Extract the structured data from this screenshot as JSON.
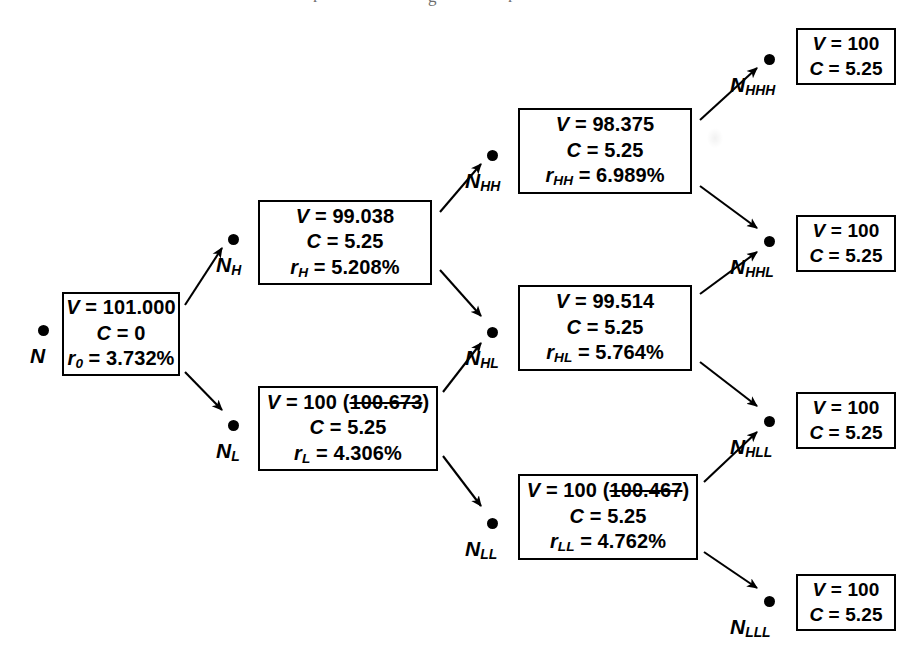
{
  "figure": {
    "kind": "binomial-interest-rate-tree",
    "cropped_caption_descenders": "r       g       r"
  },
  "nodes": [
    {
      "id": "N",
      "label": "N",
      "sub": "",
      "dot": {
        "x": 38,
        "y": 325
      },
      "label_pos": {
        "x": 30,
        "y": 345
      },
      "box": {
        "x": 62,
        "y": 292,
        "w": 118,
        "h": 84
      },
      "lines": [
        {
          "var": "V",
          "sub": "",
          "eq": "=",
          "value": "101.000",
          "strike": null,
          "suffix": ""
        },
        {
          "var": "C",
          "sub": "",
          "eq": "=",
          "value": "0",
          "strike": null,
          "suffix": ""
        },
        {
          "var": "r",
          "sub": "0",
          "eq": "=",
          "value": "3.732%",
          "strike": null,
          "suffix": ""
        }
      ]
    },
    {
      "id": "NH",
      "label": "N",
      "sub": "H",
      "dot": {
        "x": 228,
        "y": 234
      },
      "label_pos": {
        "x": 216,
        "y": 254
      },
      "box": {
        "x": 258,
        "y": 200,
        "w": 174,
        "h": 85
      },
      "lines": [
        {
          "var": "V",
          "sub": "",
          "eq": "=",
          "value": "99.038",
          "strike": null,
          "suffix": ""
        },
        {
          "var": "C",
          "sub": "",
          "eq": "=",
          "value": "5.25",
          "strike": null,
          "suffix": ""
        },
        {
          "var": "r",
          "sub": "H",
          "eq": "=",
          "value": "5.208%",
          "strike": null,
          "suffix": ""
        }
      ]
    },
    {
      "id": "NL",
      "label": "N",
      "sub": "L",
      "dot": {
        "x": 228,
        "y": 420
      },
      "label_pos": {
        "x": 216,
        "y": 440
      },
      "box": {
        "x": 258,
        "y": 386,
        "w": 180,
        "h": 85
      },
      "lines": [
        {
          "var": "V",
          "sub": "",
          "eq": "=",
          "value": "100",
          "strike": "100.673",
          "suffix": ""
        },
        {
          "var": "C",
          "sub": "",
          "eq": "=",
          "value": "5.25",
          "strike": null,
          "suffix": ""
        },
        {
          "var": "r",
          "sub": "L",
          "eq": "=",
          "value": "4.306%",
          "strike": null,
          "suffix": ""
        }
      ]
    },
    {
      "id": "NHH",
      "label": "N",
      "sub": "HH",
      "dot": {
        "x": 487,
        "y": 150
      },
      "label_pos": {
        "x": 465,
        "y": 170
      },
      "box": {
        "x": 518,
        "y": 108,
        "w": 174,
        "h": 86
      },
      "lines": [
        {
          "var": "V",
          "sub": "",
          "eq": "=",
          "value": "98.375",
          "strike": null,
          "suffix": ""
        },
        {
          "var": "C",
          "sub": "",
          "eq": "=",
          "value": "5.25",
          "strike": null,
          "suffix": ""
        },
        {
          "var": "r",
          "sub": "HH",
          "eq": "=",
          "value": "6.989%",
          "strike": null,
          "suffix": ""
        }
      ]
    },
    {
      "id": "NHL",
      "label": "N",
      "sub": "HL",
      "dot": {
        "x": 487,
        "y": 327
      },
      "label_pos": {
        "x": 465,
        "y": 347
      },
      "box": {
        "x": 518,
        "y": 285,
        "w": 174,
        "h": 86
      },
      "lines": [
        {
          "var": "V",
          "sub": "",
          "eq": "=",
          "value": "99.514",
          "strike": null,
          "suffix": ""
        },
        {
          "var": "C",
          "sub": "",
          "eq": "=",
          "value": "5.25",
          "strike": null,
          "suffix": ""
        },
        {
          "var": "r",
          "sub": "HL",
          "eq": "=",
          "value": "5.764%",
          "strike": null,
          "suffix": ""
        }
      ]
    },
    {
      "id": "NLL",
      "label": "N",
      "sub": "LL",
      "dot": {
        "x": 487,
        "y": 518
      },
      "label_pos": {
        "x": 465,
        "y": 538
      },
      "box": {
        "x": 518,
        "y": 474,
        "w": 180,
        "h": 86
      },
      "lines": [
        {
          "var": "V",
          "sub": "",
          "eq": "=",
          "value": "100",
          "strike": "100.467",
          "suffix": ""
        },
        {
          "var": "C",
          "sub": "",
          "eq": "=",
          "value": "5.25",
          "strike": null,
          "suffix": ""
        },
        {
          "var": "r",
          "sub": "LL",
          "eq": "=",
          "value": "4.762%",
          "strike": null,
          "suffix": ""
        }
      ]
    },
    {
      "id": "NHHH",
      "label": "N",
      "sub": "HHH",
      "dot": {
        "x": 764,
        "y": 54
      },
      "label_pos": {
        "x": 730,
        "y": 74
      },
      "box": {
        "x": 796,
        "y": 28,
        "w": 100,
        "h": 57
      },
      "terminal": true,
      "lines": [
        {
          "var": "V",
          "sub": "",
          "eq": "=",
          "value": "100",
          "strike": null,
          "suffix": ""
        },
        {
          "var": "C",
          "sub": "",
          "eq": "=",
          "value": "5.25",
          "strike": null,
          "suffix": ""
        }
      ]
    },
    {
      "id": "NHHL",
      "label": "N",
      "sub": "HHL",
      "dot": {
        "x": 764,
        "y": 236
      },
      "label_pos": {
        "x": 730,
        "y": 256
      },
      "box": {
        "x": 796,
        "y": 215,
        "w": 100,
        "h": 57
      },
      "terminal": true,
      "lines": [
        {
          "var": "V",
          "sub": "",
          "eq": "=",
          "value": "100",
          "strike": null,
          "suffix": ""
        },
        {
          "var": "C",
          "sub": "",
          "eq": "=",
          "value": "5.25",
          "strike": null,
          "suffix": ""
        }
      ]
    },
    {
      "id": "NHLL",
      "label": "N",
      "sub": "HLL",
      "dot": {
        "x": 764,
        "y": 416
      },
      "label_pos": {
        "x": 730,
        "y": 436
      },
      "box": {
        "x": 796,
        "y": 392,
        "w": 100,
        "h": 57
      },
      "terminal": true,
      "lines": [
        {
          "var": "V",
          "sub": "",
          "eq": "=",
          "value": "100",
          "strike": null,
          "suffix": ""
        },
        {
          "var": "C",
          "sub": "",
          "eq": "=",
          "value": "5.25",
          "strike": null,
          "suffix": ""
        }
      ]
    },
    {
      "id": "NLLL",
      "label": "N",
      "sub": "LLL",
      "dot": {
        "x": 764,
        "y": 596
      },
      "label_pos": {
        "x": 730,
        "y": 616
      },
      "box": {
        "x": 796,
        "y": 574,
        "w": 100,
        "h": 57
      },
      "terminal": true,
      "lines": [
        {
          "var": "V",
          "sub": "",
          "eq": "=",
          "value": "100",
          "strike": null,
          "suffix": ""
        },
        {
          "var": "C",
          "sub": "",
          "eq": "=",
          "value": "5.25",
          "strike": null,
          "suffix": ""
        }
      ]
    }
  ],
  "edges": [
    {
      "from": "N",
      "to": "NH",
      "x1": 185,
      "y1": 305,
      "x2": 222,
      "y2": 248
    },
    {
      "from": "N",
      "to": "NL",
      "x1": 185,
      "y1": 372,
      "x2": 222,
      "y2": 410
    },
    {
      "from": "NH",
      "to": "NHH",
      "x1": 440,
      "y1": 212,
      "x2": 481,
      "y2": 164
    },
    {
      "from": "NH",
      "to": "NHL",
      "x1": 440,
      "y1": 270,
      "x2": 481,
      "y2": 316
    },
    {
      "from": "NL",
      "to": "NHL",
      "x1": 443,
      "y1": 392,
      "x2": 481,
      "y2": 343
    },
    {
      "from": "NL",
      "to": "NLL",
      "x1": 443,
      "y1": 456,
      "x2": 481,
      "y2": 506
    },
    {
      "from": "NHH",
      "to": "NHHH",
      "x1": 700,
      "y1": 120,
      "x2": 757,
      "y2": 68
    },
    {
      "from": "NHH",
      "to": "NHHL",
      "x1": 700,
      "y1": 186,
      "x2": 757,
      "y2": 228
    },
    {
      "from": "NHL",
      "to": "NHHL",
      "x1": 700,
      "y1": 294,
      "x2": 757,
      "y2": 252
    },
    {
      "from": "NHL",
      "to": "NHLL",
      "x1": 700,
      "y1": 362,
      "x2": 757,
      "y2": 406
    },
    {
      "from": "NLL",
      "to": "NHLL",
      "x1": 704,
      "y1": 482,
      "x2": 757,
      "y2": 432
    },
    {
      "from": "NLL",
      "to": "NLLL",
      "x1": 704,
      "y1": 552,
      "x2": 757,
      "y2": 588
    }
  ],
  "chart_data": {
    "type": "diagram",
    "call_price": 100,
    "coupon": 5.25,
    "levels": [
      {
        "period": 0,
        "node_ids": [
          "N"
        ]
      },
      {
        "period": 1,
        "node_ids": [
          "NH",
          "NL"
        ]
      },
      {
        "period": 2,
        "node_ids": [
          "NHH",
          "NHL",
          "NLL"
        ]
      },
      {
        "period": 3,
        "node_ids": [
          "NHHH",
          "NHHL",
          "NHLL",
          "NLLL"
        ]
      }
    ],
    "values": {
      "N": 101.0,
      "NH": 99.038,
      "NL": 100,
      "NHH": 98.375,
      "NHL": 99.514,
      "NLL": 100,
      "NHHH": 100,
      "NHHL": 100,
      "NHLL": 100,
      "NLLL": 100
    },
    "values_uncalled": {
      "NL": 100.673,
      "NLL": 100.467
    },
    "coupons": {
      "N": 0,
      "NH": 5.25,
      "NL": 5.25,
      "NHH": 5.25,
      "NHL": 5.25,
      "NLL": 5.25,
      "NHHH": 5.25,
      "NHHL": 5.25,
      "NHLL": 5.25,
      "NLLL": 5.25
    },
    "rates_percent": {
      "N": 3.732,
      "NH": 5.208,
      "NL": 4.306,
      "NHH": 6.989,
      "NHL": 5.764,
      "NLL": 4.762
    }
  }
}
